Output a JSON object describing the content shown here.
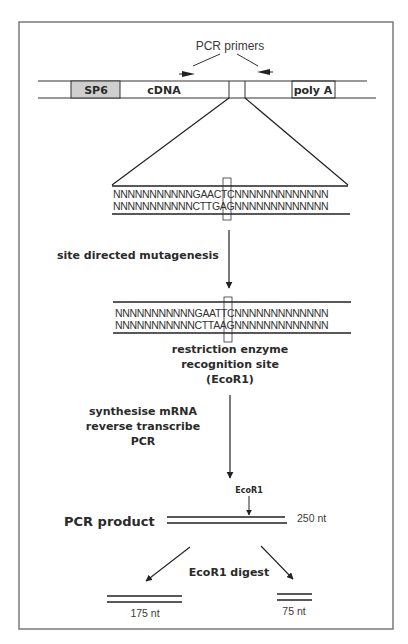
{
  "figure": {
    "primers_label": "PCR primers",
    "construct": {
      "sp6_label": "SP6",
      "cdna_label": "cDNA",
      "polya_label": "poly A",
      "colors": {
        "sp6_fill": "#cfcfcf",
        "line": "#333333"
      }
    },
    "wild_type": {
      "top_strand": "NNNNNNNNNNNGAACTCNNNNNNNNNNNNN",
      "bottom_strand": "NNNNNNNNNNNCTTGAGNNNNNNNNNNNNN"
    },
    "step1_label": "site directed mutagenesis",
    "mutant": {
      "top_strand": "NNNNNNNNNNNGAATTCNNNNNNNNNNNNN",
      "bottom_strand": "NNNNNNNNNNNCTTAAGNNNNNNNNNNNNN",
      "caption_line1": "restriction enzyme",
      "caption_line2": "recognition site",
      "caption_line3": "(EcoR1)"
    },
    "step2": {
      "line1": "synthesise mRNA",
      "line2": "reverse transcribe",
      "line3": "PCR"
    },
    "pcr_product": {
      "label": "PCR product",
      "site_label": "EcoR1",
      "size_label": "250 nt"
    },
    "digest": {
      "label": "EcoR1 digest",
      "fragment_left": "175 nt",
      "fragment_right": "75 nt"
    }
  }
}
